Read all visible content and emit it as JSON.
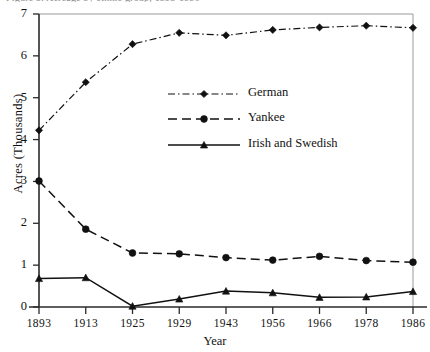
{
  "figure": {
    "caption_partial": "Figure 3.  Acreage by ethnic group, 1893-1986",
    "plot_area": {
      "x0": 39,
      "x1": 413,
      "y0": 14,
      "y1": 307
    }
  },
  "chart_data": {
    "type": "line",
    "title": "",
    "xlabel": "Year",
    "ylabel": "Acres (Thousands)",
    "x": [
      "1893",
      "1913",
      "1925",
      "1929",
      "1943",
      "1956",
      "1966",
      "1978",
      "1986"
    ],
    "categories": [
      "1893",
      "1913",
      "1925",
      "1929",
      "1943",
      "1956",
      "1966",
      "1978",
      "1986"
    ],
    "ylim": [
      0,
      7
    ],
    "yticks": [
      0,
      1,
      2,
      3,
      4,
      5,
      6,
      7
    ],
    "ytick_labels": [
      "0",
      "1",
      "2",
      "3",
      "4",
      "5",
      "6",
      "7"
    ],
    "grid": false,
    "legend_position": "upper-center",
    "series": [
      {
        "name": "German",
        "values": [
          4.22,
          5.37,
          6.28,
          6.55,
          6.49,
          6.62,
          6.68,
          6.72,
          6.67
        ],
        "line_style": "dash-dot",
        "marker": "diamond",
        "color": "#111111"
      },
      {
        "name": "Yankee",
        "values": [
          3.01,
          1.86,
          1.29,
          1.27,
          1.18,
          1.12,
          1.21,
          1.11,
          1.07
        ],
        "line_style": "dashed",
        "marker": "circle",
        "color": "#111111"
      },
      {
        "name": "Irish and Swedish",
        "values": [
          0.68,
          0.7,
          0.02,
          0.19,
          0.38,
          0.34,
          0.23,
          0.24,
          0.37
        ],
        "line_style": "solid",
        "marker": "triangle",
        "color": "#111111"
      }
    ]
  },
  "legend": {
    "entries": [
      {
        "label": "German"
      },
      {
        "label": "Yankee"
      },
      {
        "label": "Irish and Swedish"
      }
    ]
  }
}
